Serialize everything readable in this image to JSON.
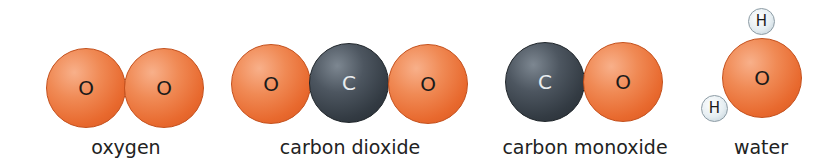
{
  "molecules": [
    {
      "name": "oxygen",
      "atoms": [
        "O",
        "O"
      ]
    },
    {
      "name": "carbon dioxide",
      "atoms": [
        "O",
        "C",
        "O"
      ]
    },
    {
      "name": "carbon monoxide",
      "atoms": [
        "C",
        "O"
      ]
    },
    {
      "name": "water",
      "atoms": [
        "H",
        "O",
        "H"
      ]
    }
  ],
  "colors": {
    "oxygen": "#e8692e",
    "carbon": "#333b43",
    "hydrogen": "#e6eef2"
  }
}
